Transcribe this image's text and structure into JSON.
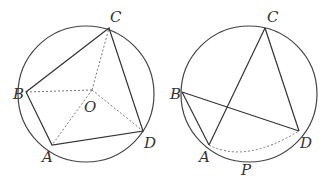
{
  "figures": [
    {
      "id": "left",
      "circle": {
        "cx": 86,
        "cy": 94,
        "r": 68
      },
      "points": {
        "C": {
          "x": 109,
          "y": 28,
          "label": "C",
          "lx": 110,
          "ly": 22
        },
        "B": {
          "x": 26,
          "y": 92,
          "label": "B",
          "lx": 13,
          "ly": 99
        },
        "A": {
          "x": 52,
          "y": 145,
          "label": "A",
          "lx": 42,
          "ly": 162
        },
        "D": {
          "x": 143,
          "y": 131,
          "label": "D",
          "lx": 144,
          "ly": 148
        },
        "O": {
          "x": 92,
          "y": 90,
          "label": "O",
          "lx": 84,
          "ly": 112
        }
      },
      "solid_segments": [
        [
          "C",
          "B"
        ],
        [
          "B",
          "A"
        ],
        [
          "A",
          "D"
        ],
        [
          "D",
          "C"
        ]
      ],
      "dotted_segments": [
        [
          "O",
          "C"
        ],
        [
          "O",
          "B"
        ],
        [
          "O",
          "A"
        ],
        [
          "O",
          "D"
        ]
      ]
    },
    {
      "id": "right",
      "circle": {
        "cx": 249,
        "cy": 94,
        "r": 68
      },
      "points": {
        "C": {
          "x": 265,
          "y": 28,
          "label": "C",
          "lx": 267,
          "ly": 22
        },
        "B": {
          "x": 182,
          "y": 92,
          "label": "B",
          "lx": 170,
          "ly": 99
        },
        "A": {
          "x": 209,
          "y": 145,
          "label": "A",
          "lx": 199,
          "ly": 162
        },
        "D": {
          "x": 299,
          "y": 131,
          "label": "D",
          "lx": 300,
          "ly": 148
        },
        "P": {
          "x": 245,
          "y": 157,
          "label": "P",
          "lx": 241,
          "ly": 174
        }
      },
      "solid_segments": [
        [
          "C",
          "A"
        ],
        [
          "C",
          "D"
        ],
        [
          "B",
          "D"
        ],
        [
          "B",
          "A"
        ]
      ],
      "dotted_path": "M209,145 Q245,162 299,131"
    }
  ],
  "labels": {
    "left_C": "C",
    "left_B": "B",
    "left_A": "A",
    "left_D": "D",
    "left_O": "O",
    "right_C": "C",
    "right_B": "B",
    "right_A": "A",
    "right_D": "D",
    "right_P": "P"
  }
}
